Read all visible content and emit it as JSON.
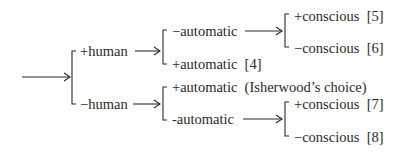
{
  "diagram": {
    "root": {
      "branches": {
        "plus_human": {
          "label": "+human",
          "branches": {
            "minus_automatic": {
              "label": "−automatic",
              "branches": {
                "plus_conscious": {
                  "label": "+conscious",
                  "ref": "[5]"
                },
                "minus_conscious": {
                  "label": "−conscious",
                  "ref": "[6]"
                }
              }
            },
            "plus_automatic": {
              "label": "+automatic",
              "ref": "[4]"
            }
          }
        },
        "minus_human": {
          "label": "−human",
          "branches": {
            "plus_automatic": {
              "label": "+automatic",
              "note": "(Isherwood’s choice)"
            },
            "minus_automatic": {
              "label": "-automatic",
              "branches": {
                "plus_conscious": {
                  "label": "+conscious",
                  "ref": "[7]"
                },
                "minus_conscious": {
                  "label": "−conscious",
                  "ref": "[8]"
                }
              }
            }
          }
        }
      }
    },
    "colors": {
      "ink": "#2a2a2a",
      "background": "#ffffff"
    }
  }
}
